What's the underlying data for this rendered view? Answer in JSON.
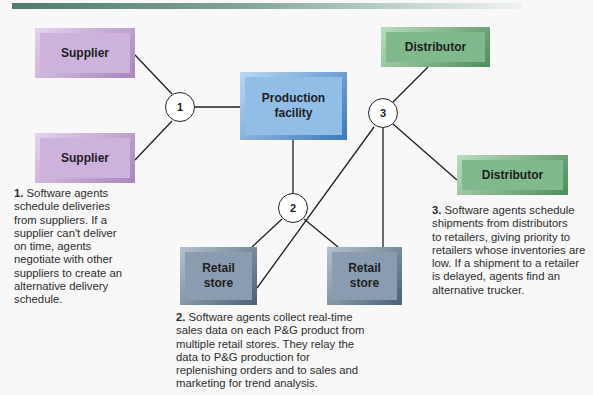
{
  "header": {
    "bar_color_start": "#4f7c6c",
    "bar_color_end": "#eef2f0"
  },
  "boxes": {
    "supplier_top": {
      "label": "Supplier",
      "color": "#cdb2dc"
    },
    "supplier_bottom": {
      "label": "Supplier",
      "color": "#cdb2dc"
    },
    "production": {
      "label_line1": "Production",
      "label_line2": "facility",
      "color": "#92bde6"
    },
    "distributor_top": {
      "label": "Distributor",
      "color": "#7fb98c"
    },
    "distributor_right": {
      "label": "Distributor",
      "color": "#7fb98c"
    },
    "retail_left": {
      "label_line1": "Retail",
      "label_line2": "store",
      "color": "#8a9db0"
    },
    "retail_right": {
      "label_line1": "Retail",
      "label_line2": "store",
      "color": "#8a9db0"
    }
  },
  "nodes": [
    {
      "label": "1"
    },
    {
      "label": "2"
    },
    {
      "label": "3"
    }
  ],
  "notes": [
    {
      "number": "1.",
      "lines": [
        "Software agents",
        "schedule deliveries",
        "from suppliers. If a",
        "supplier can't deliver",
        "on time, agents",
        "negotiate with other",
        "suppliers to create an",
        "alternative delivery",
        "schedule."
      ]
    },
    {
      "number": "2.",
      "lines": [
        "Software agents collect real-time",
        "sales data on each P&G product from",
        "multiple retail stores. They relay the",
        "data to P&G production for",
        "replenishing orders and to sales and",
        "marketing for trend analysis."
      ]
    },
    {
      "number": "3.",
      "lines": [
        "Software agents schedule",
        "shipments from distributors",
        "to retailers, giving priority to",
        "retailers whose inventories are",
        "low. If a shipment to a retailer",
        "is delayed, agents find an",
        "alternative trucker."
      ]
    }
  ]
}
